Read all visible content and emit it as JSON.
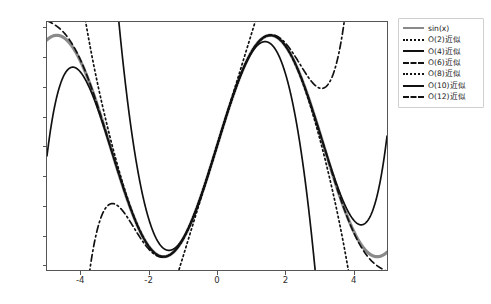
{
  "chart_data": {
    "type": "line",
    "title": "",
    "xlabel": "",
    "ylabel": "",
    "xlim": [
      -5.0,
      5.0
    ],
    "ylim": [
      -1.12,
      1.12
    ],
    "xticks": [
      "-4",
      "-2",
      "0",
      "2",
      "4"
    ],
    "xtick_values": [
      -4,
      -2,
      0,
      2,
      4
    ],
    "yticks": [
      "1.00",
      "0.75",
      "0.50",
      "0.25",
      "0.00",
      "-0.25",
      "-0.50",
      "-0.75",
      "-1.00"
    ],
    "ytick_values": [
      1.0,
      0.75,
      0.5,
      0.25,
      0.0,
      -0.25,
      -0.5,
      -0.75,
      -1.0
    ],
    "grid": false,
    "legend_position": "upper right",
    "series": [
      {
        "name": "sin(x)",
        "style": "solid",
        "color": "#8a8a8a",
        "width": 3.2,
        "function": "sin(x)"
      },
      {
        "name": "O(2)近似",
        "style": "dotted",
        "color": "#111111",
        "width": 1.7,
        "function": "x"
      },
      {
        "name": "O(4)近似",
        "style": "solid",
        "color": "#111111",
        "width": 1.7,
        "function": "x - x^3/6"
      },
      {
        "name": "O(6)近似",
        "style": "dashdot",
        "color": "#111111",
        "width": 1.7,
        "function": "x - x^3/6 + x^5/120"
      },
      {
        "name": "O(8)近似",
        "style": "dotted",
        "color": "#111111",
        "width": 1.7,
        "function": "x - x^3/6 + x^5/120 - x^7/5040"
      },
      {
        "name": "O(10)近似",
        "style": "solid",
        "color": "#111111",
        "width": 1.7,
        "function": "x - x^3/6 + x^5/120 - x^7/5040 + x^9/362880"
      },
      {
        "name": "O(12)近似",
        "style": "dashed",
        "color": "#111111",
        "width": 1.7,
        "function": "x - x^3/6 + x^5/120 - x^7/5040 + x^9/362880 - x^11/39916800"
      }
    ]
  },
  "legend": {
    "items": [
      {
        "label": "sin(x)"
      },
      {
        "label": "O(2)近似"
      },
      {
        "label": "O(4)近似"
      },
      {
        "label": "O(6)近似"
      },
      {
        "label": "O(8)近似"
      },
      {
        "label": "O(10)近似"
      },
      {
        "label": "O(12)近似"
      }
    ]
  },
  "axes": {
    "x_tick_labels": [
      "-4",
      "-2",
      "0",
      "2",
      "4"
    ],
    "y_tick_labels": [
      "1.00",
      "0.75",
      "0.50",
      "0.25",
      "0.00",
      "-0.25",
      "-0.50",
      "-0.75",
      "-1.00"
    ]
  },
  "colors": {
    "sin_line": "#8a8a8a",
    "approx_line": "#111111",
    "frame": "#555555",
    "legend_border": "#cfcfcf",
    "background": "#ffffff"
  }
}
